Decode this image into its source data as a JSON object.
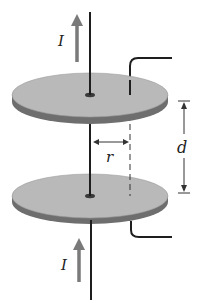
{
  "diagram": {
    "labels": {
      "current_top": "I",
      "current_bottom": "I",
      "radius": "r",
      "separation": "d"
    },
    "colors": {
      "plate_face": "#b9b9b9",
      "plate_edge": "#6e6e6e",
      "wire": "#1e1e1e",
      "current_arrow": "#7a7a7a",
      "dimension": "#333333"
    }
  }
}
